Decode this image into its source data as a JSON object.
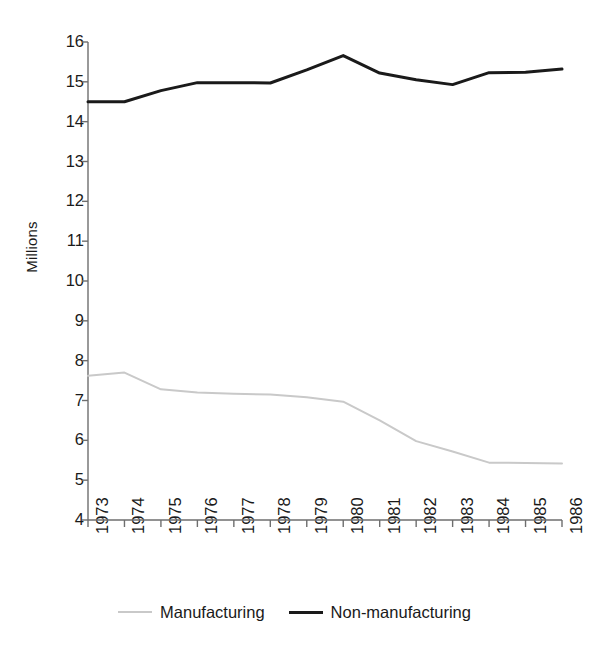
{
  "chart_data": {
    "type": "line",
    "title": "",
    "subtitle": "",
    "xlabel": "",
    "ylabel": "Millions",
    "categories": [
      "1973",
      "1974",
      "1975",
      "1976",
      "1977",
      "1978",
      "1979",
      "1980",
      "1981",
      "1982",
      "1983",
      "1984",
      "1985",
      "1986"
    ],
    "x": [
      1973,
      1974,
      1975,
      1976,
      1977,
      1978,
      1979,
      1980,
      1981,
      1982,
      1983,
      1984,
      1985,
      1986
    ],
    "ylim": [
      4,
      16
    ],
    "yticks": [
      4,
      5,
      6,
      7,
      8,
      9,
      10,
      11,
      12,
      13,
      14,
      15,
      16
    ],
    "ytick_labels": [
      "4",
      "5",
      "6",
      "7",
      "8",
      "9",
      "10",
      "11",
      "12",
      "13",
      "14",
      "15",
      "16"
    ],
    "grid": false,
    "legend_position": "bottom",
    "series": [
      {
        "name": "Manufacturing",
        "color": "#c9c9c9",
        "line_width": 2,
        "values": [
          7.62,
          7.7,
          7.28,
          7.2,
          7.17,
          7.15,
          7.08,
          6.97,
          6.5,
          5.98,
          5.72,
          5.44,
          5.43,
          5.42
        ]
      },
      {
        "name": "Non-manufacturing",
        "color": "#1a1a1a",
        "line_width": 3,
        "values": [
          14.5,
          14.5,
          14.78,
          14.98,
          14.98,
          14.97,
          15.3,
          15.66,
          15.22,
          15.05,
          14.93,
          15.23,
          15.24,
          15.32
        ]
      }
    ]
  },
  "axes": {
    "y_title": "Millions",
    "axis_color": "#6e6e6e",
    "tick_color": "#6e6e6e",
    "label_color": "#1a1a1a"
  },
  "legend": {
    "entries": [
      {
        "label": "Manufacturing",
        "swatch": "light-line-swatch"
      },
      {
        "label": "Non-manufacturing",
        "swatch": "dark-line-swatch"
      }
    ]
  }
}
